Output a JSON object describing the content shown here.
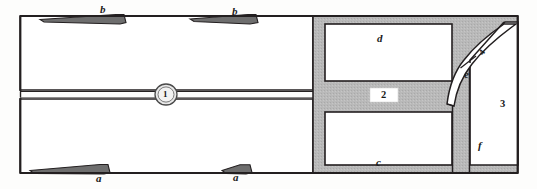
{
  "figure": {
    "kind": "technical-schematic",
    "background_color": "#fdfdfc",
    "line_color": "#231f20",
    "hatch_fill_color": "#b8b8b8",
    "white_fill_color": "#ffffff",
    "width": 537,
    "height": 189
  },
  "labels": {
    "b_left": "b",
    "b_right": "b",
    "a_left": "a",
    "a_right": "a",
    "c": "c",
    "d": "d",
    "e": "e",
    "f": "f",
    "one": "1",
    "two": "2",
    "three": "3",
    "four": "4"
  },
  "callouts": [
    {
      "id": "b_left",
      "text": "b",
      "x": 100,
      "y": 4,
      "type": "letter"
    },
    {
      "id": "b_right",
      "text": "b",
      "x": 232,
      "y": 6,
      "type": "letter"
    },
    {
      "id": "a_left",
      "text": "a",
      "x": 96,
      "y": 173,
      "type": "letter"
    },
    {
      "id": "a_right",
      "text": "a",
      "x": 233,
      "y": 172,
      "type": "letter"
    },
    {
      "id": "d",
      "text": "d",
      "x": 377,
      "y": 33,
      "type": "letter"
    },
    {
      "id": "c",
      "text": "c",
      "x": 376,
      "y": 157,
      "type": "letter"
    },
    {
      "id": "f",
      "text": "f",
      "x": 478,
      "y": 140,
      "type": "letter"
    },
    {
      "id": "e",
      "text": "e",
      "x": 464,
      "y": 69,
      "type": "letter"
    },
    {
      "id": "one",
      "text": "1",
      "x": 162,
      "y": 91,
      "type": "num-small"
    },
    {
      "id": "two",
      "text": "2",
      "x": 383,
      "y": 95,
      "type": "num"
    },
    {
      "id": "three",
      "text": "3",
      "x": 502,
      "y": 99,
      "type": "num"
    },
    {
      "id": "four",
      "text": "4",
      "x": 482,
      "y": 49,
      "type": "num-small"
    }
  ]
}
